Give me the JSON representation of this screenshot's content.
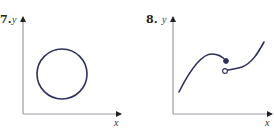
{
  "figures": [
    {
      "number": "7.",
      "y_label": "y",
      "x_label": "x",
      "description": "circle",
      "axes": {
        "origin": [
          23,
          114
        ],
        "x_end": 120,
        "y_end": 18
      },
      "circle": {
        "cx": 62,
        "cy": 74,
        "r": 25
      }
    },
    {
      "number": "8.",
      "y_label": "y",
      "x_label": "x",
      "description": "piecewise curve with jump discontinuity: closed dot on left branch, open dot on right branch",
      "axes": {
        "origin": [
          173,
          114
        ],
        "x_end": 272,
        "y_end": 18
      },
      "left_branch_path": "M179,92 C188,74 200,54 212,54 C219,54 223,57 226,61",
      "right_branch_path": "M225,71 C230,69 236,69 242,67 C252,63 258,53 264,42",
      "closed_dot": [
        226,
        61
      ],
      "open_dot": [
        225,
        71
      ]
    }
  ],
  "colors": {
    "curve": "#2e2f5c",
    "axis": "#9a9aa8",
    "arrow": "#222222"
  }
}
